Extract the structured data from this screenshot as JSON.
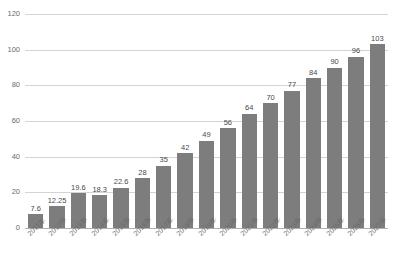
{
  "chart_data": {
    "type": "bar",
    "title": "",
    "xlabel": "",
    "ylabel": "",
    "ylim": [
      0,
      120
    ],
    "yticks": [
      0,
      20,
      40,
      60,
      80,
      100,
      120
    ],
    "ytick_labels": [
      "0",
      "20",
      "40",
      "60",
      "80",
      "100",
      "120"
    ],
    "grid": true,
    "legend": "none",
    "bar_color": "#7d7d7d",
    "gridline_color": "#d4d4d4",
    "categories": [
      "2011年",
      "2012年",
      "2013年",
      "2014年",
      "2015年",
      "2016年",
      "2017年",
      "2018年",
      "2019年",
      "2020年",
      "2021年",
      "2022年",
      "2023年",
      "2024年",
      "2025年",
      "2026年",
      "2027年"
    ],
    "values": [
      7.6,
      12.25,
      19.6,
      18.3,
      22.6,
      28,
      35,
      42,
      49,
      56,
      64,
      70,
      77,
      84,
      90,
      96,
      103
    ],
    "data_labels": [
      "7.6",
      "12.25",
      "19.6",
      "18.3",
      "22.6",
      "28",
      "35",
      "42",
      "49",
      "56",
      "64",
      "70",
      "77",
      "84",
      "90",
      "96",
      "103"
    ]
  }
}
